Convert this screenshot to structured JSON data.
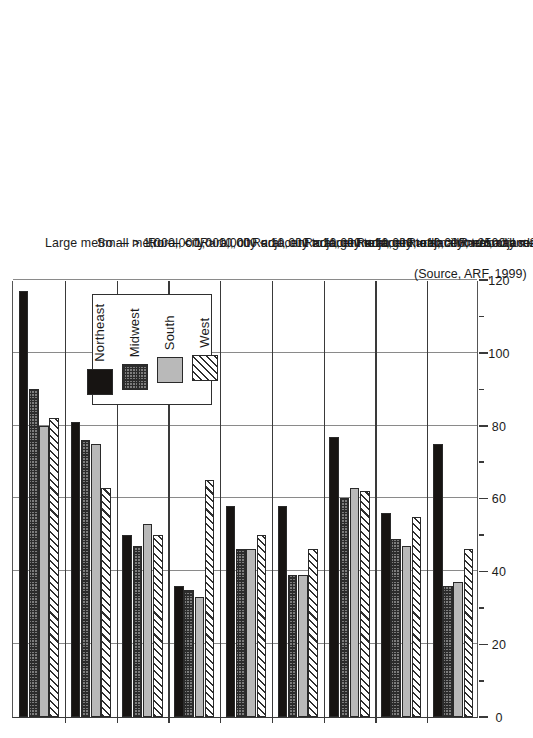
{
  "chart_data": {
    "type": "bar",
    "title": "",
    "subtitle": "",
    "xlabel": "",
    "ylabel": "",
    "source_note": "(Source, ARF, 1999)",
    "orientation": "rotated-vertical-bars",
    "grid": true,
    "legend_position": "inside-top-center",
    "ylim": [
      0,
      120
    ],
    "ytick_step": 20,
    "yminor_step": 10,
    "tick_labels": [
      "0",
      "20",
      "40",
      "60",
      "80",
      "100",
      "120"
    ],
    "tick_values": [
      0,
      20,
      40,
      60,
      80,
      100,
      120
    ],
    "categories": [
      "Large metro — > 1,000,000",
      "Small metro — < 1,000,000",
      "Rural, city > 10,000 adjacent to large metro",
      "Rural, city < 10,000 adjacent to large metro",
      "Rural, city > 10,000 adjacent to small metro",
      "Rural, city < 10,000, adjacent to small metro",
      "Rural, city > 10,000, not adjacent to metro",
      "Rural, city > 2500 and < 10,000, not adjacent to metro",
      "Rural, city < 2500, not adjacent to metro"
    ],
    "series": [
      {
        "name": "Northeast",
        "pattern": "solid-black",
        "color": "#171412",
        "values": [
          117,
          81,
          50,
          36,
          58,
          58,
          77,
          56,
          75
        ]
      },
      {
        "name": "Midwest",
        "pattern": "checkered",
        "color": "#7d7d7d",
        "values": [
          90,
          76,
          47,
          35,
          46,
          39,
          60,
          49,
          36
        ]
      },
      {
        "name": "South",
        "pattern": "solid-gray",
        "color": "#b9b9b9",
        "values": [
          80,
          75,
          53,
          33,
          46,
          39,
          63,
          47,
          37
        ]
      },
      {
        "name": "West",
        "pattern": "diagonal-hatch",
        "color": "#ffffff",
        "values": [
          82,
          63,
          50,
          65,
          50,
          46,
          62,
          55,
          46
        ]
      }
    ]
  },
  "legend": {
    "items": [
      {
        "label": "Northeast"
      },
      {
        "label": "Midwest"
      },
      {
        "label": "South"
      },
      {
        "label": "West"
      }
    ]
  }
}
